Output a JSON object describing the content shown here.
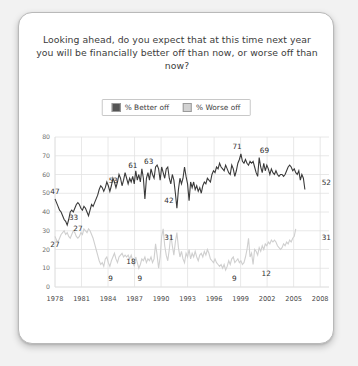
{
  "card": {
    "title": "Looking ahead, do you expect that at this time next year you will be financially better off than now, or worse off than now?"
  },
  "legend": {
    "position": "top-center",
    "entries": [
      {
        "label": "% Better off",
        "color": "#555555",
        "swatch": "dark-swatch"
      },
      {
        "label": "% Worse off",
        "color": "#d2d2d2",
        "swatch": "light-swatch"
      }
    ]
  },
  "chart_data": {
    "type": "line",
    "title": "Looking ahead, do you expect that at this time next year you will be financially better off than now, or worse off than now?",
    "xlabel": "",
    "ylabel": "",
    "xlim": [
      1978,
      2009
    ],
    "ylim": [
      0,
      80
    ],
    "grid": true,
    "legend_position": "top-center",
    "yticks": [
      0,
      10,
      20,
      30,
      40,
      50,
      60,
      70,
      80
    ],
    "xticks": [
      1978,
      1981,
      1984,
      1987,
      1990,
      1993,
      1996,
      1999,
      2002,
      2005,
      2008
    ],
    "annotations": [
      {
        "series": "% Better off",
        "x": 1978.0,
        "value": 47,
        "text": "47"
      },
      {
        "series": "% Better off",
        "x": 1980.1,
        "value": 33,
        "text": "33"
      },
      {
        "series": "% Better off",
        "x": 1980.6,
        "value": 27,
        "text": "27"
      },
      {
        "series": "% Better off",
        "x": 1984.6,
        "value": 53,
        "text": "53"
      },
      {
        "series": "% Better off",
        "x": 1986.8,
        "value": 61,
        "text": "61"
      },
      {
        "series": "% Better off",
        "x": 1988.6,
        "value": 63,
        "text": "63"
      },
      {
        "series": "% Better off",
        "x": 1990.9,
        "value": 42,
        "text": "42"
      },
      {
        "series": "% Better off",
        "x": 1998.6,
        "value": 71,
        "text": "71"
      },
      {
        "series": "% Better off",
        "x": 2001.7,
        "value": 69,
        "text": "69"
      },
      {
        "series": "% Better off",
        "x": 2008.7,
        "value": 52,
        "text": "52"
      },
      {
        "series": "% Worse off",
        "x": 1978.0,
        "value": 27,
        "text": "27"
      },
      {
        "series": "% Worse off",
        "x": 1984.3,
        "value": 9,
        "text": "9"
      },
      {
        "series": "% Worse off",
        "x": 1986.6,
        "value": 18,
        "text": "18"
      },
      {
        "series": "% Worse off",
        "x": 1987.6,
        "value": 9,
        "text": "9"
      },
      {
        "series": "% Worse off",
        "x": 1990.9,
        "value": 31,
        "text": "31"
      },
      {
        "series": "% Worse off",
        "x": 1998.3,
        "value": 9,
        "text": "9"
      },
      {
        "series": "% Worse off",
        "x": 2001.9,
        "value": 12,
        "text": "12"
      },
      {
        "series": "% Worse off",
        "x": 2008.7,
        "value": 31,
        "text": "31"
      }
    ],
    "series": [
      {
        "name": "% Better off",
        "color": "#3a3a3a",
        "width": 1.1,
        "x_start": 1978.0,
        "x_step": 0.1724,
        "values": [
          47,
          45,
          43,
          41,
          40,
          38,
          36,
          35,
          33,
          36,
          40,
          41,
          40,
          42,
          44,
          45,
          44,
          42,
          41,
          43,
          42,
          40,
          38,
          41,
          44,
          43,
          45,
          47,
          49,
          52,
          54,
          53,
          51,
          53,
          56,
          54,
          51,
          54,
          58,
          56,
          53,
          56,
          60,
          58,
          54,
          57,
          61,
          58,
          55,
          58,
          56,
          59,
          55,
          62,
          57,
          60,
          56,
          63,
          58,
          47,
          58,
          61,
          57,
          63,
          60,
          58,
          64,
          65,
          63,
          57,
          64,
          61,
          58,
          63,
          64,
          58,
          55,
          60,
          57,
          50,
          42,
          52,
          58,
          55,
          58,
          64,
          59,
          55,
          46,
          56,
          53,
          56,
          52,
          54,
          51,
          53,
          50,
          54,
          56,
          55,
          58,
          57,
          56,
          60,
          62,
          61,
          64,
          63,
          66,
          64,
          63,
          62,
          65,
          63,
          61,
          60,
          65,
          63,
          59,
          62,
          66,
          68,
          71,
          67,
          66,
          68,
          66,
          65,
          67,
          66,
          67,
          64,
          61,
          59,
          69,
          64,
          61,
          66,
          62,
          65,
          63,
          60,
          63,
          61,
          60,
          62,
          60,
          59,
          60,
          60,
          59,
          60,
          62,
          64,
          65,
          64,
          62,
          63,
          61,
          60,
          62,
          57,
          60,
          58,
          52
        ]
      },
      {
        "name": "% Worse off",
        "color": "#cfcfcf",
        "width": 1.1,
        "x_start": 1978.0,
        "x_step": 0.1724,
        "values": [
          27,
          25,
          24,
          26,
          28,
          29,
          30,
          28,
          29,
          27,
          26,
          28,
          30,
          29,
          27,
          26,
          27,
          29,
          28,
          31,
          30,
          29,
          31,
          30,
          28,
          26,
          23,
          20,
          17,
          14,
          12,
          13,
          11,
          15,
          16,
          13,
          11,
          14,
          16,
          18,
          15,
          13,
          16,
          17,
          18,
          16,
          17,
          16,
          17,
          15,
          17,
          14,
          11,
          16,
          13,
          10,
          12,
          15,
          14,
          16,
          13,
          15,
          14,
          16,
          13,
          15,
          23,
          17,
          10,
          16,
          27,
          31,
          22,
          17,
          14,
          20,
          28,
          22,
          17,
          24,
          29,
          21,
          16,
          19,
          15,
          13,
          18,
          16,
          20,
          15,
          18,
          16,
          19,
          16,
          14,
          17,
          18,
          16,
          19,
          17,
          20,
          18,
          15,
          14,
          13,
          15,
          13,
          12,
          11,
          12,
          10,
          12,
          9,
          11,
          14,
          12,
          15,
          16,
          13,
          14,
          15,
          13,
          14,
          12,
          13,
          16,
          20,
          26,
          16,
          18,
          12,
          20,
          19,
          17,
          21,
          19,
          22,
          20,
          23,
          22,
          24,
          23,
          25,
          24,
          25,
          24,
          22,
          21,
          20,
          21,
          23,
          22,
          24,
          23,
          25,
          24,
          26,
          27,
          31
        ]
      }
    ]
  }
}
